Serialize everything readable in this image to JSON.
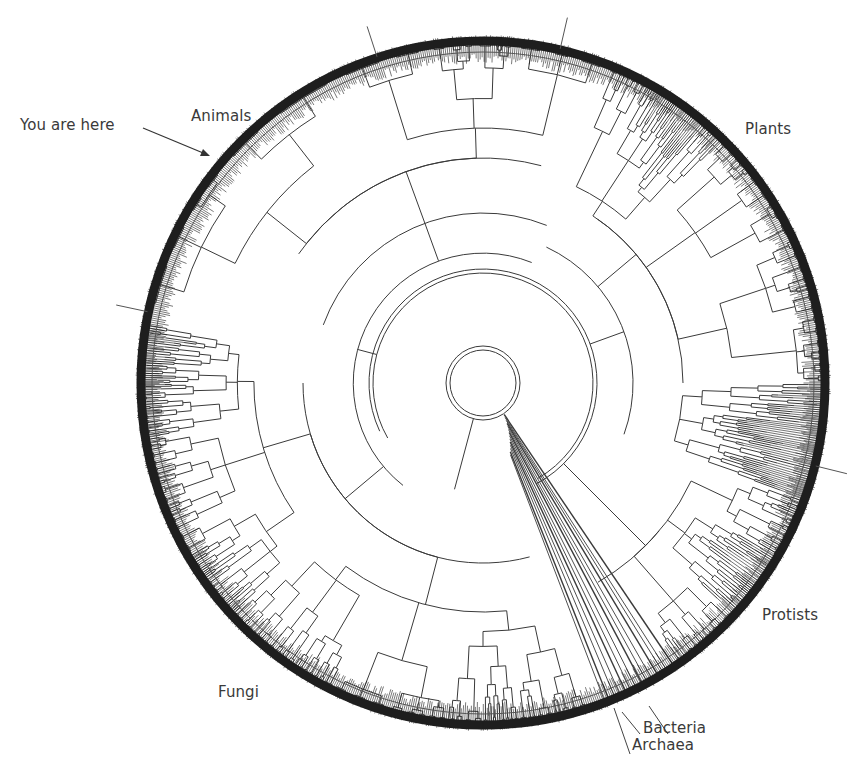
{
  "diagram": {
    "type": "circular-phylogenetic-tree",
    "title": "",
    "center": [
      483,
      383
    ],
    "outer_radius": 345,
    "colors": {
      "line": "#3a3a3a",
      "ring": "#1e1e1e",
      "text": "#3a3a3a",
      "background": "#ffffff"
    },
    "labels": {
      "animals": "Animals",
      "you_are_here": "You are here",
      "plants": "Plants",
      "protists": "Protists",
      "fungi": "Fungi",
      "bacteria": "Bacteria",
      "archaea": "Archaea"
    },
    "clades": [
      {
        "name": "Animals",
        "start_deg": 190,
        "end_deg": 292
      },
      {
        "name": "Plants",
        "start_deg": 292,
        "end_deg": 20
      },
      {
        "name": "Protists",
        "start_deg": 20,
        "end_deg": 55
      },
      {
        "name": "Bacteria",
        "start_deg": 55,
        "end_deg": 66
      },
      {
        "name": "Archaea",
        "start_deg": 66,
        "end_deg": 70
      },
      {
        "name": "Fungi",
        "start_deg": 70,
        "end_deg": 190
      }
    ],
    "boundary_ticks_deg": [
      -108,
      -77,
      14,
      192
    ]
  }
}
